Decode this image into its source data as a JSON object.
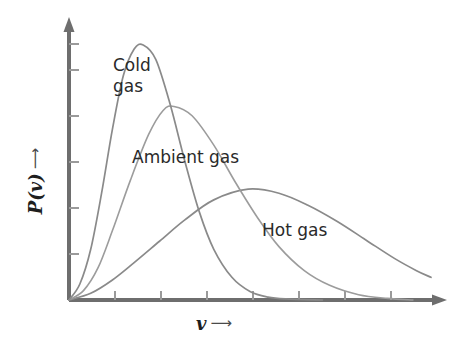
{
  "chart_data": {
    "type": "line",
    "title": "",
    "subtitle": "",
    "xlabel": "v",
    "ylabel": "P(v)",
    "xlabel_arrow": "⟶",
    "ylabel_arrow": "⟶",
    "grid": false,
    "legend": "inline-annotations",
    "axis_style": "arrow-tipped open axes, unlabeled ticks",
    "xlim": [
      0,
      1
    ],
    "ylim": [
      0,
      1
    ],
    "x_tick_count": 8,
    "y_tick_count": 6,
    "x_tick_labels": [],
    "y_tick_labels": [],
    "series": [
      {
        "name": "Cold gas",
        "label": "Cold\ngas",
        "color": "#8a8a8a",
        "peak_x": 0.205,
        "peak_y": 0.955,
        "x": [
          0.0,
          0.03,
          0.06,
          0.09,
          0.12,
          0.15,
          0.18,
          0.205,
          0.24,
          0.28,
          0.32,
          0.36,
          0.4,
          0.45,
          0.5,
          0.55,
          0.6,
          0.7
        ],
        "y": [
          0.0,
          0.06,
          0.19,
          0.4,
          0.64,
          0.84,
          0.94,
          0.955,
          0.9,
          0.73,
          0.52,
          0.33,
          0.19,
          0.085,
          0.032,
          0.011,
          0.004,
          0.0
        ]
      },
      {
        "name": "Ambient gas",
        "label": "Ambient gas",
        "color": "#9c9c9c",
        "peak_x": 0.29,
        "peak_y": 0.725,
        "x": [
          0.0,
          0.04,
          0.08,
          0.12,
          0.17,
          0.22,
          0.26,
          0.29,
          0.34,
          0.4,
          0.46,
          0.52,
          0.58,
          0.65,
          0.72,
          0.8,
          0.88,
          0.95
        ],
        "y": [
          0.0,
          0.035,
          0.12,
          0.26,
          0.45,
          0.62,
          0.71,
          0.725,
          0.69,
          0.58,
          0.44,
          0.31,
          0.2,
          0.11,
          0.055,
          0.02,
          0.006,
          0.0
        ]
      },
      {
        "name": "Hot gas",
        "label": "Hot gas",
        "color": "#8a8a8a",
        "peak_x": 0.495,
        "peak_y": 0.415,
        "x": [
          0.0,
          0.06,
          0.12,
          0.18,
          0.25,
          0.32,
          0.4,
          0.495,
          0.58,
          0.66,
          0.74,
          0.82,
          0.9,
          0.96,
          1.0
        ],
        "y": [
          0.0,
          0.025,
          0.075,
          0.14,
          0.22,
          0.3,
          0.375,
          0.415,
          0.4,
          0.355,
          0.295,
          0.225,
          0.155,
          0.11,
          0.085
        ]
      }
    ]
  },
  "axes": {
    "color": "#6e6e6e",
    "tick_color": "#8f8f8f",
    "y_axis_name": "vertical-axis",
    "x_axis_name": "horizontal-axis"
  },
  "labels": {
    "cold_line1": "Cold",
    "cold_line2": "gas",
    "ambient": "Ambient gas",
    "hot": "Hot gas",
    "y_axis": "P(v)",
    "x_axis": "v",
    "arrow": "⟶"
  }
}
